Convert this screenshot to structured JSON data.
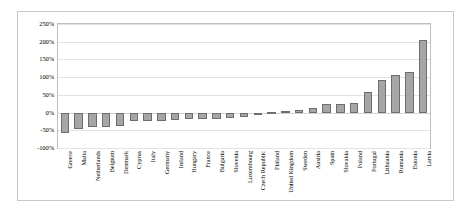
{
  "chart_data": {
    "type": "bar",
    "title": "",
    "xlabel": "",
    "ylabel": "",
    "ylim": [
      -100,
      250
    ],
    "ytick_labels": [
      "250%",
      "200%",
      "150%",
      "100%",
      "50%",
      "0%",
      "-50%",
      "-100%"
    ],
    "ytick_values": [
      250,
      200,
      150,
      100,
      50,
      0,
      -50,
      -100
    ],
    "grid": true,
    "legend": "none",
    "bar_fill_color": "#a6a6a6",
    "bar_border_color": "#6e6e6e",
    "categories": [
      "Greece",
      "Malta",
      "Netherlands",
      "Belgium",
      "Denmark",
      "Cyprus",
      "Italy",
      "Germany",
      "Ireland",
      "Hungary",
      "France",
      "Bulgaria",
      "Slovenia",
      "Luxembourg",
      "Czech Republic",
      "Finland",
      "United Kingdom",
      "Sweden",
      "Austria",
      "Spain",
      "Slovakia",
      "Poland",
      "Portugal",
      "Lithuania",
      "Romania",
      "Estonia",
      "Latvia"
    ],
    "values": [
      -58,
      -45,
      -42,
      -40,
      -38,
      -25,
      -24,
      -23,
      -20,
      -18,
      -17,
      -17,
      -16,
      -12,
      -3,
      3,
      4,
      8,
      13,
      23,
      24,
      27,
      58,
      92,
      105,
      115,
      205
    ]
  }
}
